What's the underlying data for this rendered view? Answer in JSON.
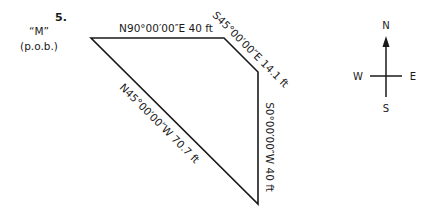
{
  "problem": {
    "number": "5.",
    "point_label": "“M”",
    "point_sublabel": "(p.o.b.)"
  },
  "traverse": {
    "stroke_color": "#1a1a1a",
    "vertices": [
      [
        91,
        38
      ],
      [
        224,
        38
      ],
      [
        258,
        72
      ],
      [
        258,
        204
      ]
    ],
    "courses": [
      {
        "bearing": "N90°00′00″E",
        "distance": "40 ft",
        "label": "N90°00′00″E 40 ft"
      },
      {
        "bearing": "S45°00′00″E",
        "distance": "14.1 ft",
        "label": "S45°00′00″E 14.1 ft"
      },
      {
        "bearing": "S0°00′00″W",
        "distance": "40 ft",
        "label": "S0°00′00″W 40 ft"
      },
      {
        "bearing": "N45°00′00″W",
        "distance": "70.7 ft",
        "label": "N45°00′00″W 70.7 ft"
      }
    ]
  },
  "compass": {
    "north": "N",
    "south": "S",
    "east": "E",
    "west": "W"
  }
}
